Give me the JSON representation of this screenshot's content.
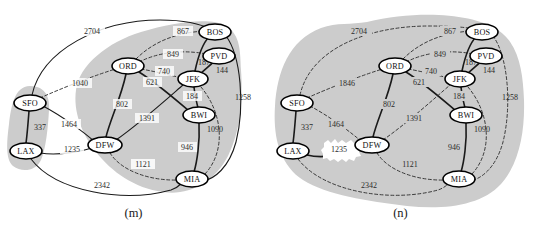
{
  "figure": {
    "panels": [
      {
        "id": "m",
        "caption": "(m)",
        "nodes": [
          {
            "id": "SFO",
            "label": "SFO",
            "x": 30,
            "y": 103
          },
          {
            "id": "LAX",
            "label": "LAX",
            "x": 26,
            "y": 151
          },
          {
            "id": "DFW",
            "label": "DFW",
            "x": 105,
            "y": 145
          },
          {
            "id": "ORD",
            "label": "ORD",
            "x": 128,
            "y": 66
          },
          {
            "id": "JFK",
            "label": "JFK",
            "x": 193,
            "y": 79
          },
          {
            "id": "BWI",
            "label": "BWI",
            "x": 199,
            "y": 115
          },
          {
            "id": "MIA",
            "label": "MIA",
            "x": 192,
            "y": 179
          },
          {
            "id": "BOS",
            "label": "BOS",
            "x": 215,
            "y": 32
          },
          {
            "id": "PVD",
            "label": "PVD",
            "x": 219,
            "y": 56
          }
        ],
        "edges": [
          {
            "from": "SFO",
            "to": "LAX",
            "weight": "337",
            "style": "solid"
          },
          {
            "from": "SFO",
            "to": "DFW",
            "weight": "1464",
            "style": "solid"
          },
          {
            "from": "SFO",
            "to": "ORD",
            "weight": "1040",
            "style": "dashed"
          },
          {
            "from": "SFO",
            "to": "BOS",
            "weight": "2704",
            "style": "solid"
          },
          {
            "from": "LAX",
            "to": "DFW",
            "weight": "1235",
            "style": "solid"
          },
          {
            "from": "LAX",
            "to": "MIA",
            "weight": "2342",
            "style": "solid"
          },
          {
            "from": "DFW",
            "to": "ORD",
            "weight": "802",
            "style": "solid"
          },
          {
            "from": "DFW",
            "to": "JFK",
            "weight": "1391",
            "style": "solid"
          },
          {
            "from": "DFW",
            "to": "MIA",
            "weight": "1121",
            "style": "dashed"
          },
          {
            "from": "ORD",
            "to": "JFK",
            "weight": "740",
            "style": "dashed"
          },
          {
            "from": "ORD",
            "to": "BWI",
            "weight": "621",
            "style": "solid"
          },
          {
            "from": "ORD",
            "to": "BOS",
            "weight": "867",
            "style": "dashed"
          },
          {
            "from": "ORD",
            "to": "PVD",
            "weight": "849",
            "style": "dashed"
          },
          {
            "from": "JFK",
            "to": "BWI",
            "weight": "184",
            "style": "solid"
          },
          {
            "from": "JFK",
            "to": "BOS",
            "weight": "187",
            "style": "solid"
          },
          {
            "from": "JFK",
            "to": "PVD",
            "weight": "144",
            "style": "solid"
          },
          {
            "from": "JFK",
            "to": "MIA",
            "weight": "1090",
            "style": "dashed"
          },
          {
            "from": "BWI",
            "to": "MIA",
            "weight": "946",
            "style": "solid"
          },
          {
            "from": "BOS",
            "to": "MIA",
            "weight": "1258",
            "style": "solid"
          }
        ],
        "clusters": [
          "cluster-sfo-lax",
          "cluster-main"
        ]
      },
      {
        "id": "n",
        "caption": "(n)",
        "nodes": [
          {
            "id": "SFO",
            "label": "SFO",
            "x": 30,
            "y": 103
          },
          {
            "id": "LAX",
            "label": "LAX",
            "x": 26,
            "y": 151
          },
          {
            "id": "DFW",
            "label": "DFW",
            "x": 105,
            "y": 145
          },
          {
            "id": "ORD",
            "label": "ORD",
            "x": 128,
            "y": 66
          },
          {
            "id": "JFK",
            "label": "JFK",
            "x": 193,
            "y": 79
          },
          {
            "id": "BWI",
            "label": "BWI",
            "x": 199,
            "y": 115
          },
          {
            "id": "MIA",
            "label": "MIA",
            "x": 192,
            "y": 179
          },
          {
            "id": "BOS",
            "label": "BOS",
            "x": 215,
            "y": 32
          },
          {
            "id": "PVD",
            "label": "PVD",
            "x": 219,
            "y": 56
          }
        ],
        "edges": [
          {
            "from": "SFO",
            "to": "LAX",
            "weight": "337",
            "style": "solid"
          },
          {
            "from": "SFO",
            "to": "DFW",
            "weight": "1464",
            "style": "dashed"
          },
          {
            "from": "SFO",
            "to": "ORD",
            "weight": "1846",
            "style": "dashed"
          },
          {
            "from": "SFO",
            "to": "BOS",
            "weight": "2704",
            "style": "dashed"
          },
          {
            "from": "LAX",
            "to": "DFW",
            "weight": "1235",
            "style": "solid"
          },
          {
            "from": "LAX",
            "to": "MIA",
            "weight": "2342",
            "style": "dashed"
          },
          {
            "from": "DFW",
            "to": "ORD",
            "weight": "802",
            "style": "solid"
          },
          {
            "from": "DFW",
            "to": "JFK",
            "weight": "1391",
            "style": "dashed"
          },
          {
            "from": "DFW",
            "to": "MIA",
            "weight": "1121",
            "style": "dashed"
          },
          {
            "from": "ORD",
            "to": "JFK",
            "weight": "740",
            "style": "dashed"
          },
          {
            "from": "ORD",
            "to": "BWI",
            "weight": "621",
            "style": "solid"
          },
          {
            "from": "ORD",
            "to": "BOS",
            "weight": "867",
            "style": "dashed"
          },
          {
            "from": "ORD",
            "to": "PVD",
            "weight": "849",
            "style": "dashed"
          },
          {
            "from": "JFK",
            "to": "BWI",
            "weight": "184",
            "style": "solid"
          },
          {
            "from": "JFK",
            "to": "BOS",
            "weight": "187",
            "style": "solid"
          },
          {
            "from": "JFK",
            "to": "PVD",
            "weight": "144",
            "style": "solid"
          },
          {
            "from": "JFK",
            "to": "MIA",
            "weight": "1090",
            "style": "dashed"
          },
          {
            "from": "BWI",
            "to": "MIA",
            "weight": "946",
            "style": "solid"
          },
          {
            "from": "BOS",
            "to": "MIA",
            "weight": "1258",
            "style": "dashed"
          }
        ],
        "clusters": [
          "cluster-all"
        ]
      }
    ],
    "colors": {
      "cluster_fill": "#cccccc",
      "edge_solid": "#1a1a1a",
      "edge_dashed": "#3a3a3a",
      "node_fill": "#ffffff",
      "node_stroke": "#000000",
      "text": "#1a1a1a",
      "highlight_fill": "#ffffff"
    },
    "highlights": [
      {
        "panel": "n",
        "label": "1235"
      }
    ]
  }
}
